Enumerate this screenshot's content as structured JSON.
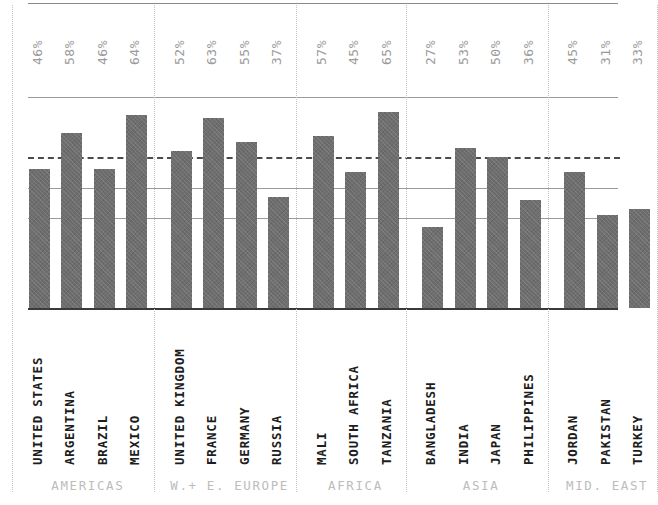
{
  "chart_data": {
    "type": "bar",
    "title": "",
    "subtitle": "",
    "xlabel": "",
    "ylabel": "",
    "ylim": [
      0,
      80
    ],
    "grid": true,
    "legend_position": "none",
    "value_suffix": "%",
    "reference_line": {
      "value": 50,
      "style": "dashed",
      "label": ""
    },
    "gridline_values": [
      70,
      50,
      40,
      30
    ],
    "categories": [
      "UNITED STATES",
      "ARGENTINA",
      "BRAZIL",
      "MEXICO",
      "UNITED KINGDOM",
      "FRANCE",
      "GERMANY",
      "RUSSIA",
      "MALI",
      "SOUTH AFRICA",
      "TANZANIA",
      "BANGLADESH",
      "INDIA",
      "JAPAN",
      "PHILIPPINES",
      "JORDAN",
      "PAKISTAN",
      "TURKEY"
    ],
    "values": [
      46,
      58,
      46,
      64,
      52,
      63,
      55,
      37,
      57,
      45,
      65,
      27,
      53,
      50,
      36,
      45,
      31,
      33
    ],
    "value_labels": [
      "46%",
      "58%",
      "46%",
      "64%",
      "52%",
      "63%",
      "55%",
      "37%",
      "57%",
      "45%",
      "65%",
      "27%",
      "53%",
      "50%",
      "36%",
      "45%",
      "31%",
      "33%"
    ],
    "groups": [
      {
        "label": "AMERICAS",
        "count": 4
      },
      {
        "label": "W.+ E. EUROPE",
        "count": 4
      },
      {
        "label": "AFRICA",
        "count": 3
      },
      {
        "label": "ASIA",
        "count": 4
      },
      {
        "label": "MID. EAST",
        "count": 3
      }
    ],
    "colors": {
      "bar": "#6e6e6e",
      "baseline": "#3a3a3a",
      "gridline": "#9a9a9a",
      "reference_line": "#4a4a4a",
      "separator": "#c4c4c4",
      "value_label": "#9b9b9b",
      "category_label": "#1d1d1d",
      "group_label": "#bcbcbc"
    }
  }
}
